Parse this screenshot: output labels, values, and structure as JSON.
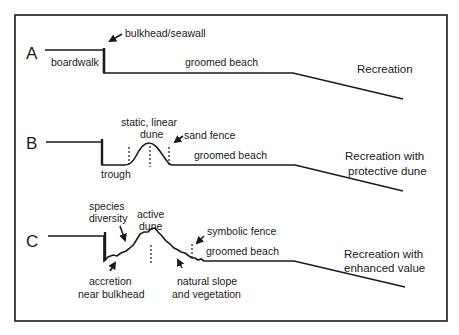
{
  "diagram": {
    "title": "",
    "colors": {
      "line": "#1a1a1a",
      "background": "#ffffff"
    },
    "panels": [
      {
        "id": "A",
        "letter": "A",
        "labels": {
          "bulkhead": "bulkhead/seawall",
          "boardwalk": "boardwalk",
          "beach": "groomed beach"
        },
        "description_lines": [
          "Recreation"
        ]
      },
      {
        "id": "B",
        "letter": "B",
        "labels": {
          "dune_line1": "static, linear",
          "dune_line2": "dune",
          "fence": "sand fence",
          "beach": "groomed beach",
          "trough": "trough"
        },
        "description_lines": [
          "Recreation with",
          "protective dune"
        ]
      },
      {
        "id": "C",
        "letter": "C",
        "labels": {
          "species_line1": "species",
          "species_line2": "diversity",
          "dune_line1": "active",
          "dune_line2": "dune",
          "fence": "symbolic fence",
          "beach": "groomed beach",
          "accretion_line1": "accretion",
          "accretion_line2": "near bulkhead",
          "slope_line1": "natural slope",
          "slope_line2": "and vegetation"
        },
        "description_lines": [
          "Recreation with",
          "enhanced value"
        ]
      }
    ]
  }
}
